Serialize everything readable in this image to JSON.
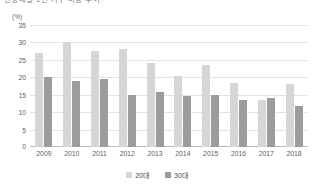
{
  "chart_data": {
    "type": "bar",
    "title": "연령대별 1인 가구 비중 추이",
    "subtitle": "",
    "xlabel": "",
    "ylabel": "(%)",
    "unit_label": "(%)",
    "categories": [
      "2009",
      "2010",
      "2011",
      "2012",
      "2013",
      "2014",
      "2015",
      "2016",
      "2017",
      "2018"
    ],
    "series": [
      {
        "name": "20대",
        "color": "#d6d6d6",
        "values": [
          27.0,
          30.0,
          27.5,
          28.0,
          24.0,
          20.5,
          23.5,
          18.5,
          13.5,
          18.0
        ]
      },
      {
        "name": "30대",
        "color": "#9c9c9c",
        "values": [
          20.0,
          19.0,
          19.5,
          15.0,
          15.7,
          14.7,
          15.0,
          13.5,
          14.0,
          11.8
        ]
      }
    ],
    "ylim": [
      0,
      35
    ],
    "yticks": [
      0,
      5,
      10,
      15,
      20,
      25,
      30,
      35
    ],
    "ytick_labels": [
      "0",
      "5",
      "10",
      "15",
      "20",
      "25",
      "30",
      "35"
    ],
    "grid": true,
    "legend_position": "bottom"
  }
}
